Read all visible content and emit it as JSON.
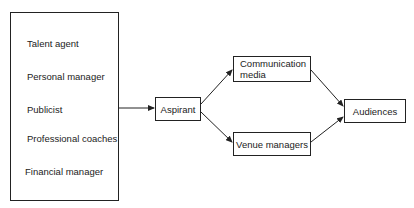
{
  "diagram": {
    "support_group": {
      "items": [
        "Talent agent",
        "Personal manager",
        "Publicist",
        "Professional coaches",
        "Financial manager"
      ]
    },
    "aspirant": "Aspirant",
    "communication_media": {
      "line1": "Communication",
      "line2": "media"
    },
    "venue_managers": "Venue managers",
    "audiences": "Audiences"
  }
}
